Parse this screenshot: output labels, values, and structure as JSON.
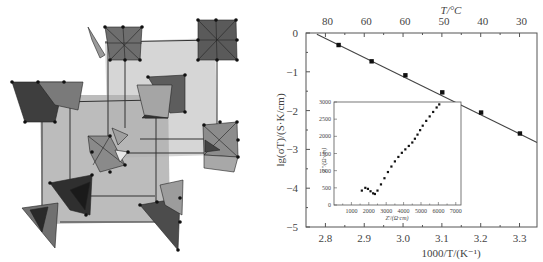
{
  "figure": {
    "left_panel": {
      "description": "crystal-structure-rendering",
      "colors": {
        "background": "#ffffff",
        "face_light": "#b5b5b5",
        "face_mid": "#8c8c8c",
        "face_dark": "#4a4a4a",
        "edge": "#222222"
      }
    }
  },
  "chart_data": {
    "type": "scatter",
    "title": "",
    "xlabel": "1000/T/(K⁻¹)",
    "ylabel": "lg(σT)/(S·K/cm)",
    "top_xlabel": "T/°C",
    "xlim": [
      2.75,
      3.345
    ],
    "ylim": [
      -5,
      0
    ],
    "x_ticks": [
      2.8,
      2.9,
      3.0,
      3.1,
      3.2,
      3.3
    ],
    "x_tick_labels": [
      "2.8",
      "2.9",
      "3.0",
      "3.1",
      "3.2",
      "3.3"
    ],
    "y_ticks": [
      0,
      -1,
      -2,
      -3,
      -4,
      -5
    ],
    "y_tick_labels": [
      "0",
      "−1",
      "−2",
      "−3",
      "−4",
      "−5"
    ],
    "top_tick_labels": [
      "80",
      "60",
      "60",
      "50",
      "40",
      "30"
    ],
    "grid": false,
    "series": [
      {
        "name": "measured",
        "marker": "square",
        "x": [
          2.834,
          2.919,
          3.006,
          3.101,
          3.201,
          3.301
        ],
        "y": [
          -0.31,
          -0.73,
          -1.09,
          -1.53,
          -2.05,
          -2.59
        ]
      },
      {
        "name": "linear fit",
        "marker": "line",
        "x": [
          2.778,
          3.345
        ],
        "y": [
          -0.03,
          -2.82
        ]
      }
    ],
    "inset": {
      "type": "scatter",
      "xlabel": "Z'/(Ω·cm)",
      "ylabel": "Z''/(Ω·cm)",
      "xlim": [
        0,
        7300
      ],
      "ylim": [
        0,
        3000
      ],
      "x_ticks": [
        1000,
        2000,
        3000,
        4000,
        5000,
        6000,
        7000
      ],
      "x_tick_labels": [
        "1000",
        "2000",
        "3000",
        "4000",
        "5000",
        "6000",
        "7000"
      ],
      "y_ticks": [
        0,
        500,
        1000,
        1500,
        2000,
        2500,
        3000
      ],
      "y_tick_labels": [
        "0",
        "500",
        "1000",
        "1500",
        "2000",
        "2500",
        "3000"
      ],
      "series": [
        {
          "name": "impedance",
          "x": [
            1600,
            1800,
            1950,
            2100,
            2250,
            2350,
            2500,
            2700,
            2900,
            3100,
            3300,
            3500,
            3700,
            3900,
            4100,
            4300,
            4500,
            4650,
            4800,
            4950,
            5100,
            5300,
            5500,
            5700,
            5900,
            6050
          ],
          "y": [
            420,
            500,
            470,
            400,
            340,
            320,
            420,
            600,
            780,
            960,
            1120,
            1270,
            1400,
            1520,
            1620,
            1720,
            1820,
            1930,
            2050,
            2180,
            2310,
            2450,
            2580,
            2710,
            2840,
            2930
          ]
        }
      ]
    }
  }
}
